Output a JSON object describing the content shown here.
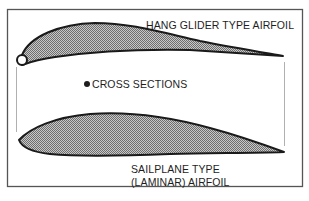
{
  "diagram": {
    "type": "airfoil-comparison",
    "frame": {
      "stroke": "#555555"
    },
    "colors": {
      "fill_hatch": "#9a9a9a",
      "outline": "#1a1a1a",
      "guide_lines": "#b0b0b0"
    },
    "shapes": [
      {
        "id": "hang-glider-airfoil",
        "label": "HANG GLIDER TYPE AIRFOIL",
        "features": [
          "rounded leading edge tube",
          "thin cambered section",
          "sharp trailing edge"
        ]
      },
      {
        "id": "sailplane-airfoil",
        "label": "SAILPLANE TYPE (LAMINAR) AIRFOIL",
        "features": [
          "symmetric-ish laminar section",
          "pointed trailing edge"
        ]
      }
    ]
  },
  "labels": {
    "hang_glider": "HANG GLIDER TYPE AIRFOIL",
    "cross_sections": "CROSS SECTIONS",
    "sailplane_line1": "SAILPLANE TYPE",
    "sailplane_line2": "(LAMINAR) AIRFOIL"
  }
}
